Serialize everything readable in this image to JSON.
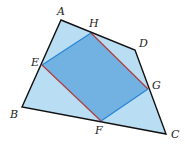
{
  "figure": {
    "type": "quadrilateral-with-inscribed-parallelogram",
    "colors": {
      "outer_fill": "#b9ddf3",
      "inner_fill": "#72b2e2",
      "outer_stroke": "#111111",
      "blue_edge": "#2a86d6",
      "red_edge": "#b04040"
    },
    "vertices": {
      "A": {
        "label": "A",
        "x": 61,
        "y": 20
      },
      "B": {
        "label": "B",
        "x": 22,
        "y": 107
      },
      "C": {
        "label": "C",
        "x": 166,
        "y": 134
      },
      "D": {
        "label": "D",
        "x": 135,
        "y": 50
      }
    },
    "midpoints": {
      "E": {
        "label": "E",
        "x": 42,
        "y": 65
      },
      "F": {
        "label": "F",
        "x": 101,
        "y": 121
      },
      "G": {
        "label": "G",
        "x": 148,
        "y": 89
      },
      "H": {
        "label": "H",
        "x": 91,
        "y": 33
      }
    },
    "labels": {
      "A": {
        "text": "A",
        "x": 57,
        "y": 15
      },
      "B": {
        "text": "B",
        "x": 10,
        "y": 118
      },
      "C": {
        "text": "C",
        "x": 171,
        "y": 138
      },
      "D": {
        "text": "D",
        "x": 139,
        "y": 47
      },
      "E": {
        "text": "E",
        "x": 31,
        "y": 66
      },
      "F": {
        "text": "F",
        "x": 95,
        "y": 134
      },
      "G": {
        "text": "G",
        "x": 152,
        "y": 89
      },
      "H": {
        "text": "H",
        "x": 89,
        "y": 27
      }
    }
  }
}
